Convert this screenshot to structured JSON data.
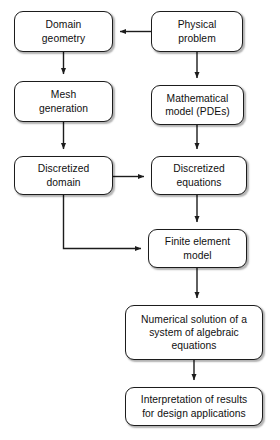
{
  "diagram": {
    "background_color": "#ffffff",
    "line_color": "#1c1c1c",
    "text_color": "#101010",
    "nodes": [
      {
        "id": "domain_geometry",
        "label": "Domain\ngeometry"
      },
      {
        "id": "physical_problem",
        "label": "Physical\nproblem"
      },
      {
        "id": "mesh_generation",
        "label": "Mesh\ngeneration"
      },
      {
        "id": "mathematical_model",
        "label": "Mathematical\nmodel (PDEs)"
      },
      {
        "id": "discretized_domain",
        "label": "Discretized\ndomain"
      },
      {
        "id": "discretized_equations",
        "label": "Discretized\nequations"
      },
      {
        "id": "finite_element_model",
        "label": "Finite element\nmodel"
      },
      {
        "id": "numerical_solution",
        "label": "Numerical solution of a\nsystem of algebraic\nequations"
      },
      {
        "id": "interpretation",
        "label": "Interpretation of results\nfor design applications"
      }
    ],
    "edges": [
      {
        "from": "physical_problem",
        "to": "domain_geometry",
        "kind": "horizontal-left"
      },
      {
        "from": "physical_problem",
        "to": "mathematical_model",
        "kind": "vertical-down"
      },
      {
        "from": "domain_geometry",
        "to": "mesh_generation",
        "kind": "vertical-down"
      },
      {
        "from": "mesh_generation",
        "to": "discretized_domain",
        "kind": "vertical-down"
      },
      {
        "from": "mathematical_model",
        "to": "discretized_equations",
        "kind": "vertical-down"
      },
      {
        "from": "discretized_domain",
        "to": "discretized_equations",
        "kind": "horizontal-right"
      },
      {
        "from": "discretized_equations",
        "to": "finite_element_model",
        "kind": "vertical-down"
      },
      {
        "from": "discretized_domain",
        "to": "finite_element_model",
        "kind": "elbow-down-right"
      },
      {
        "from": "finite_element_model",
        "to": "numerical_solution",
        "kind": "vertical-down"
      },
      {
        "from": "numerical_solution",
        "to": "interpretation",
        "kind": "vertical-down"
      }
    ]
  }
}
